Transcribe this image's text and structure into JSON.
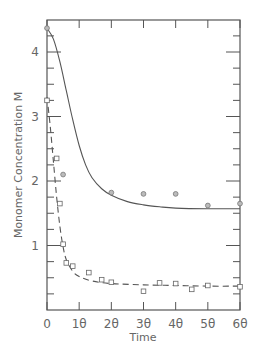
{
  "chart_data": {
    "type": "line",
    "title": "",
    "xlabel": "Time",
    "ylabel": "Monomer Concentration  M",
    "xlim": [
      0,
      60
    ],
    "ylim": [
      0,
      4.5
    ],
    "grid": false,
    "legend": null,
    "x_ticks": [
      0,
      10,
      20,
      30,
      40,
      50,
      60
    ],
    "x_tick_labels": [
      "0",
      "1θ",
      "2θ",
      "3θ",
      "4θ",
      "5θ",
      "6θ"
    ],
    "y_ticks": [
      1,
      2,
      3,
      4
    ],
    "y_tick_labels": [
      "1",
      "2",
      "3",
      "4"
    ],
    "series": [
      {
        "name": "circles (solid fit)",
        "marker": "circle",
        "line_style": "solid",
        "points": [
          [
            0,
            4.37
          ],
          [
            5,
            2.1
          ],
          [
            20,
            1.82
          ],
          [
            30,
            1.8
          ],
          [
            40,
            1.8
          ],
          [
            50,
            1.62
          ],
          [
            60,
            1.65
          ]
        ],
        "fit_curve": [
          [
            0,
            4.37
          ],
          [
            2,
            4.2
          ],
          [
            4,
            3.85
          ],
          [
            6,
            3.4
          ],
          [
            8,
            2.95
          ],
          [
            10,
            2.55
          ],
          [
            12,
            2.25
          ],
          [
            14,
            2.05
          ],
          [
            17,
            1.88
          ],
          [
            20,
            1.78
          ],
          [
            25,
            1.68
          ],
          [
            30,
            1.63
          ],
          [
            35,
            1.6
          ],
          [
            40,
            1.58
          ],
          [
            50,
            1.57
          ],
          [
            60,
            1.57
          ]
        ]
      },
      {
        "name": "squares (dashed fit)",
        "marker": "square",
        "line_style": "dashed",
        "points": [
          [
            0,
            3.25
          ],
          [
            3,
            2.35
          ],
          [
            4,
            1.65
          ],
          [
            5,
            1.02
          ],
          [
            6,
            0.73
          ],
          [
            8,
            0.68
          ],
          [
            13,
            0.58
          ],
          [
            17,
            0.47
          ],
          [
            20,
            0.43
          ],
          [
            30,
            0.29
          ],
          [
            35,
            0.42
          ],
          [
            40,
            0.41
          ],
          [
            45,
            0.32
          ],
          [
            50,
            0.38
          ],
          [
            60,
            0.36
          ]
        ],
        "fit_curve": [
          [
            0,
            3.3
          ],
          [
            1,
            2.85
          ],
          [
            2,
            2.3
          ],
          [
            3,
            1.75
          ],
          [
            4,
            1.3
          ],
          [
            5,
            0.98
          ],
          [
            6,
            0.78
          ],
          [
            8,
            0.6
          ],
          [
            10,
            0.52
          ],
          [
            14,
            0.45
          ],
          [
            20,
            0.41
          ],
          [
            30,
            0.39
          ],
          [
            40,
            0.38
          ],
          [
            50,
            0.37
          ],
          [
            60,
            0.37
          ]
        ]
      }
    ]
  },
  "colors": {
    "axis": "#555555",
    "line": "#555555",
    "marker_fill": "#bbbbbb",
    "text": "#666666"
  }
}
